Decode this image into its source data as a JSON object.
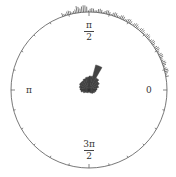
{
  "chart_data": {
    "type": "rose",
    "title": "",
    "center": [
      89,
      90
    ],
    "radius": 78,
    "axis_labels": {
      "zero": "0",
      "half_pi": {
        "num": "π",
        "den": "2"
      },
      "pi": "π",
      "three_half_pi": {
        "num": "3π",
        "den": "2"
      }
    },
    "grid": false,
    "rose_bins_deg": [
      0,
      15,
      30,
      45,
      60,
      75,
      90,
      105,
      120,
      135,
      150,
      165,
      180,
      195,
      210,
      225,
      240,
      255,
      270,
      285,
      300,
      315,
      330,
      345
    ],
    "rose_values": [
      8,
      10,
      12,
      14,
      26,
      14,
      13,
      12,
      11,
      11,
      10,
      9,
      8,
      6,
      4,
      3,
      3,
      2,
      2,
      3,
      4,
      5,
      6,
      7
    ],
    "rim_histogram_deg_range": [
      10,
      110
    ],
    "rim_histogram_note": "small outward tick marks along circle rim between ~10° and ~110°"
  }
}
